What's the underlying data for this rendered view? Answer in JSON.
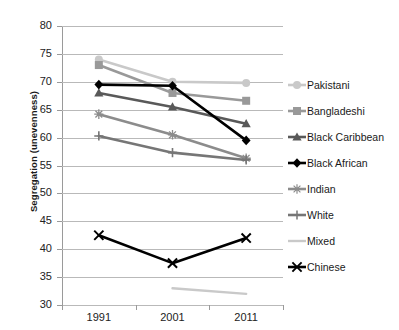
{
  "chart_data": {
    "type": "line",
    "title": "",
    "xlabel": "",
    "ylabel": "Segregation (unevenness)",
    "categories": [
      "1991",
      "2001",
      "2011"
    ],
    "x": [
      1991,
      2001,
      2011
    ],
    "ylim": [
      30,
      80
    ],
    "yticks": [
      30,
      35,
      40,
      45,
      50,
      55,
      60,
      65,
      70,
      75,
      80
    ],
    "grid": true,
    "legend_position": "right",
    "series": [
      {
        "name": "Pakistani",
        "values": [
          74.0,
          70.0,
          69.8
        ],
        "color": "#c9c9c9",
        "marker": "circle"
      },
      {
        "name": "Bangladeshi",
        "values": [
          73.0,
          68.0,
          66.6
        ],
        "color": "#999999",
        "marker": "square"
      },
      {
        "name": "Black Caribbean",
        "values": [
          68.0,
          65.5,
          62.5
        ],
        "color": "#595959",
        "marker": "triangle"
      },
      {
        "name": "Black African",
        "values": [
          69.5,
          69.3,
          59.5
        ],
        "color": "#000000",
        "marker": "diamond"
      },
      {
        "name": "Indian",
        "values": [
          64.2,
          60.5,
          56.3
        ],
        "color": "#8c8c8c",
        "marker": "asterisk"
      },
      {
        "name": "White",
        "values": [
          60.3,
          57.3,
          56.0
        ],
        "color": "#767676",
        "marker": "plus"
      },
      {
        "name": "Mixed",
        "values": [
          null,
          33.0,
          32.0
        ],
        "color": "#c9c9c9",
        "marker": "none"
      },
      {
        "name": "Chinese",
        "values": [
          42.5,
          37.5,
          42.0
        ],
        "color": "#000000",
        "marker": "cross"
      }
    ]
  },
  "legend": {
    "items": [
      {
        "label": "Pakistani"
      },
      {
        "label": "Bangladeshi"
      },
      {
        "label": "Black Caribbean"
      },
      {
        "label": "Black African"
      },
      {
        "label": "Indian"
      },
      {
        "label": "White"
      },
      {
        "label": "Mixed"
      },
      {
        "label": "Chinese"
      }
    ]
  }
}
